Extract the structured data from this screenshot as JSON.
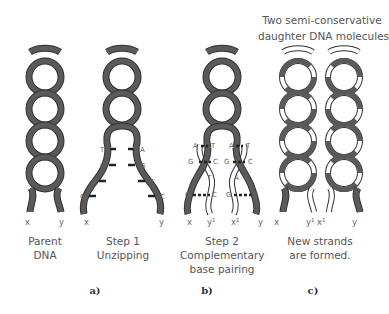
{
  "title": {
    "line1": "Two semi-conservative",
    "line2": "daughter DNA molecules"
  },
  "colors": {
    "old_strand": "#555555",
    "new_strand": "#ffffff",
    "outline": "#333333"
  },
  "panels": [
    {
      "id": "parent",
      "caption_line1": "Parent",
      "caption_line2": "DNA",
      "strand_labels": [
        "x",
        "y"
      ]
    },
    {
      "id": "step1",
      "caption_line1": "Step 1",
      "caption_line2": "Unzipping",
      "strand_labels": [
        "x",
        "y"
      ],
      "left_bases": [
        "T",
        "C",
        "A",
        "G"
      ],
      "right_bases": [
        "A",
        "G",
        "T",
        "C"
      ],
      "part_label": "a)"
    },
    {
      "id": "step2",
      "caption_line1": "Step 2",
      "caption_line2": "Complementary",
      "caption_line3": "base pairing",
      "strand_labels": [
        "x",
        "y¹",
        "x¹",
        "y"
      ],
      "left_pairs": [
        [
          "A",
          "T"
        ],
        [
          "G",
          "C"
        ],
        [
          "A",
          "T"
        ],
        [
          "G",
          "C"
        ]
      ],
      "right_pairs": [
        [
          "A",
          "T"
        ],
        [
          "G",
          "C"
        ],
        [
          "A",
          "T"
        ],
        [
          "G",
          "C"
        ]
      ],
      "part_label": "b)"
    },
    {
      "id": "daughters",
      "caption_line1": "New strands",
      "caption_line2": "are formed.",
      "strand_labels": [
        "x",
        "y¹",
        "x¹",
        "y"
      ],
      "part_label": "c)"
    }
  ]
}
